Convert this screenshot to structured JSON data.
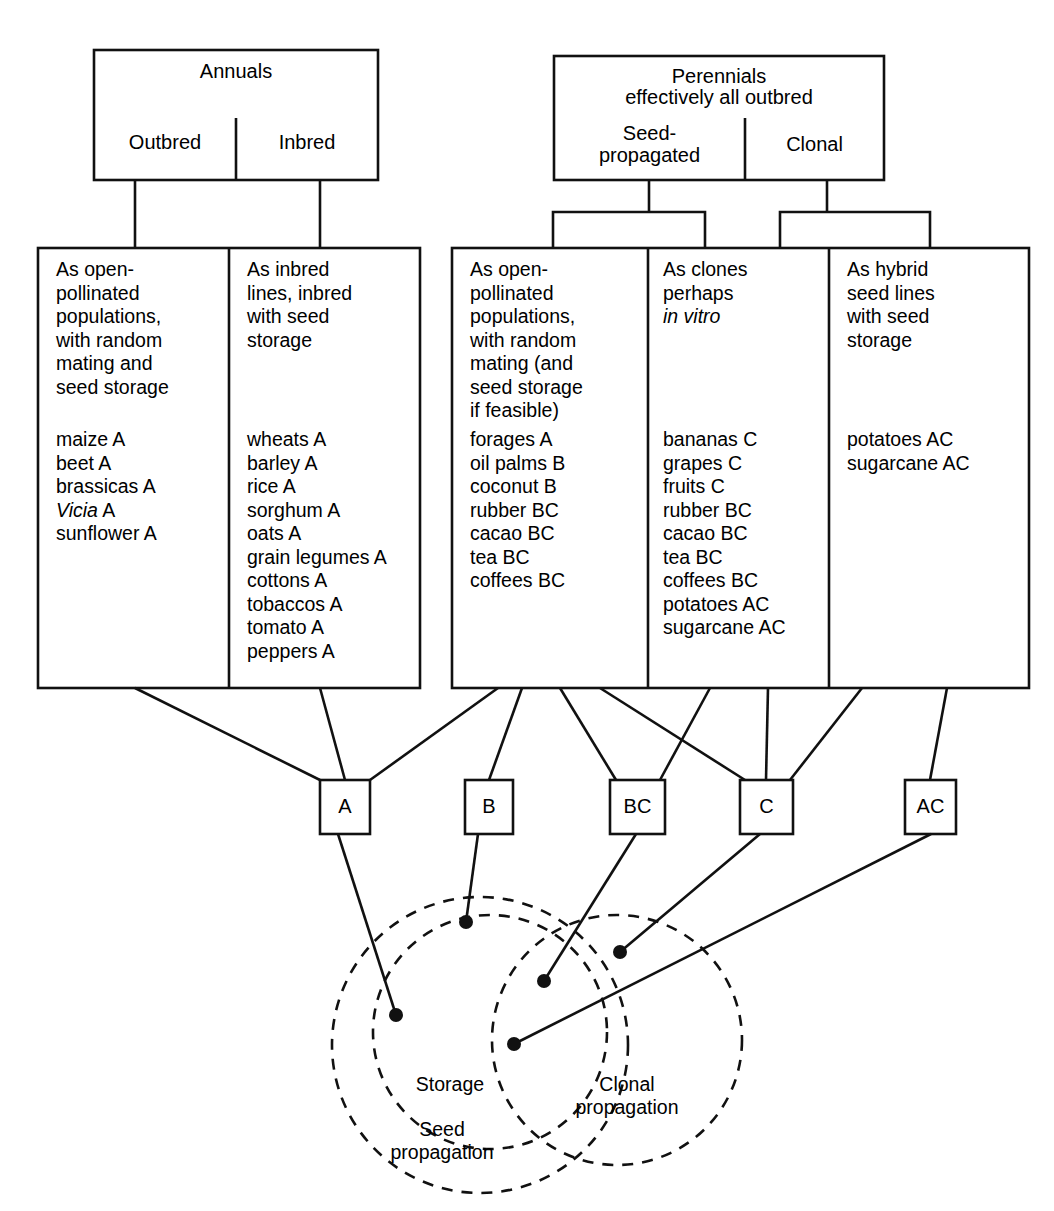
{
  "diagram": {
    "stroke_color": "#111111",
    "background_color": "#ffffff"
  },
  "top_groups": [
    {
      "id": "annuals",
      "heading": "Annuals",
      "subheads": [
        "Outbred",
        "Inbred"
      ]
    },
    {
      "id": "perennials",
      "heading_line1": "Perennials",
      "heading_line2": "effectively all outbred",
      "subheads": [
        "Seed-\npropagated",
        "Clonal"
      ]
    }
  ],
  "columns": [
    {
      "id": "annuals-outbred",
      "description": "As open-\npollinated\npopulations,\nwith random\nmating and\nseed storage",
      "items": [
        {
          "name": "maize",
          "code": "A",
          "italic": false
        },
        {
          "name": "beet",
          "code": "A",
          "italic": false
        },
        {
          "name": "brassicas",
          "code": "A",
          "italic": false
        },
        {
          "name": "Vicia",
          "code": "A",
          "italic": true
        },
        {
          "name": "sunflower",
          "code": "A",
          "italic": false
        }
      ]
    },
    {
      "id": "annuals-inbred",
      "description": "As inbred\nlines, inbred\nwith seed\nstorage",
      "items": [
        {
          "name": "wheats",
          "code": "A",
          "italic": false
        },
        {
          "name": "barley",
          "code": "A",
          "italic": false
        },
        {
          "name": "rice",
          "code": "A",
          "italic": false
        },
        {
          "name": "sorghum",
          "code": "A",
          "italic": false
        },
        {
          "name": "oats",
          "code": "A",
          "italic": false
        },
        {
          "name": "grain legumes",
          "code": "A",
          "italic": false
        },
        {
          "name": "cottons",
          "code": "A",
          "italic": false
        },
        {
          "name": "tobaccos",
          "code": "A",
          "italic": false
        },
        {
          "name": "tomato",
          "code": "A",
          "italic": false
        },
        {
          "name": "peppers",
          "code": "A",
          "italic": false
        }
      ]
    },
    {
      "id": "perennials-seed-propagated",
      "description": "As open-\npollinated\npopulations,\nwith random\nmating (and\nseed storage\nif feasible)",
      "items": [
        {
          "name": "forages",
          "code": "A",
          "italic": false
        },
        {
          "name": "oil palms",
          "code": "B",
          "italic": false
        },
        {
          "name": "coconut",
          "code": "B",
          "italic": false
        },
        {
          "name": "rubber",
          "code": "BC",
          "italic": false
        },
        {
          "name": "cacao",
          "code": "BC",
          "italic": false
        },
        {
          "name": "tea",
          "code": "BC",
          "italic": false
        },
        {
          "name": "coffees",
          "code": "BC",
          "italic": false
        }
      ]
    },
    {
      "id": "perennials-clonal-clones",
      "description": "As clones\nperhaps\nin vitro",
      "description_italic_part": "in vitro",
      "items": [
        {
          "name": "bananas",
          "code": "C",
          "italic": false
        },
        {
          "name": "grapes",
          "code": "C",
          "italic": false
        },
        {
          "name": "fruits",
          "code": "C",
          "italic": false
        },
        {
          "name": "rubber",
          "code": "BC",
          "italic": false
        },
        {
          "name": "cacao",
          "code": "BC",
          "italic": false
        },
        {
          "name": "tea",
          "code": "BC",
          "italic": false
        },
        {
          "name": "coffees",
          "code": "BC",
          "italic": false
        },
        {
          "name": "potatoes",
          "code": "AC",
          "italic": false
        },
        {
          "name": "sugarcane",
          "code": "AC",
          "italic": false
        }
      ]
    },
    {
      "id": "perennials-clonal-hybrid",
      "description": "As hybrid\nseed lines\nwith seed\nstorage",
      "items": [
        {
          "name": "potatoes",
          "code": "AC",
          "italic": false
        },
        {
          "name": "sugarcane",
          "code": "AC",
          "italic": false
        }
      ]
    }
  ],
  "code_boxes": [
    {
      "id": "code-a",
      "label": "A"
    },
    {
      "id": "code-b",
      "label": "B"
    },
    {
      "id": "code-bc",
      "label": "BC"
    },
    {
      "id": "code-c",
      "label": "C"
    },
    {
      "id": "code-ac",
      "label": "AC"
    }
  ],
  "circles": [
    {
      "id": "seed-propagation",
      "label": "Seed\npropagation"
    },
    {
      "id": "storage",
      "label": "Storage"
    },
    {
      "id": "clonal-propagation",
      "label": "Clonal\npropagation"
    }
  ]
}
